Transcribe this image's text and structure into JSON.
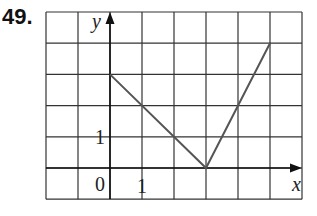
{
  "problem": {
    "number": "49."
  },
  "chart_data": {
    "type": "line",
    "title": "",
    "xlabel": "x",
    "ylabel": "y",
    "xlim": [
      -2,
      6
    ],
    "ylim": [
      -1,
      5
    ],
    "grid": true,
    "grid_step": 1,
    "tick_labels": {
      "origin": "0",
      "x": [
        "1"
      ],
      "y": [
        "1"
      ]
    },
    "series": [
      {
        "name": "graph",
        "points": [
          [
            0,
            3
          ],
          [
            3,
            0
          ],
          [
            5,
            4
          ]
        ]
      }
    ],
    "colors": {
      "grid": "#333333",
      "axis": "#111111",
      "line": "#555555"
    }
  },
  "labels": {
    "x_axis": "x",
    "y_axis": "y",
    "origin": "0",
    "x_tick": "1",
    "y_tick": "1"
  }
}
